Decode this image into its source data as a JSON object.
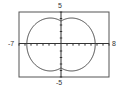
{
  "chart_data": {
    "type": "line",
    "plot_kind": "polar",
    "title": "",
    "equation_estimate": "r = 3.6 + 2.1|cos(theta)|",
    "xlim": [
      -7,
      8
    ],
    "ylim": [
      -5,
      5
    ],
    "tick_labels": {
      "x_min": "-7",
      "x_max": "8",
      "y_max": "5",
      "y_min": "-5"
    },
    "grid": false,
    "axes_ticks": "unit tick marks on both axes",
    "series": [
      {
        "name": "curve",
        "description": "closed peanut-shaped polar curve symmetric about both axes; x-extent about ±5.7, y-extent about ±3.9 with dimples of 3.6 at x=0",
        "points": [
          [
            5.7,
            0
          ],
          [
            5.3,
            2.0
          ],
          [
            4.2,
            3.3
          ],
          [
            2.4,
            3.9
          ],
          [
            1.0,
            3.8
          ],
          [
            0,
            3.6
          ],
          [
            -1.0,
            3.8
          ],
          [
            -2.4,
            3.9
          ],
          [
            -4.2,
            3.3
          ],
          [
            -5.3,
            2.0
          ],
          [
            -5.7,
            0
          ],
          [
            -5.3,
            -2.0
          ],
          [
            -4.2,
            -3.3
          ],
          [
            -2.4,
            -3.9
          ],
          [
            -1.0,
            -3.8
          ],
          [
            0,
            -3.6
          ],
          [
            1.0,
            -3.8
          ],
          [
            2.4,
            -3.9
          ],
          [
            4.2,
            -3.3
          ],
          [
            5.3,
            -2.0
          ],
          [
            5.7,
            0
          ]
        ]
      }
    ]
  },
  "labels": {
    "ymax": "5",
    "ymin": "-5",
    "xmin": "-7",
    "xmax": "8"
  }
}
